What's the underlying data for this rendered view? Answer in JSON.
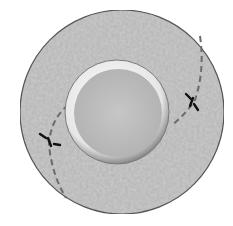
{
  "diagram": {
    "type": "cross-section",
    "outer_disc": {
      "cx": 122,
      "cy": 112,
      "r": 102,
      "fill": "#c4c4c4",
      "stroke": "#555555"
    },
    "inner_rim": {
      "cx": 117,
      "cy": 112,
      "r": 52,
      "fill": "#e8e8e8"
    },
    "inner_disc": {
      "cx": 118,
      "cy": 113,
      "r": 44,
      "fill": "#bdbdbd"
    },
    "crack_lines": [
      {
        "name": "left-crack",
        "color": "#666666"
      },
      {
        "name": "right-crack",
        "color": "#666666"
      }
    ],
    "markers": [
      {
        "name": "left-marker",
        "x": 49,
        "y": 140
      },
      {
        "name": "right-marker",
        "x": 193,
        "y": 102
      }
    ]
  }
}
